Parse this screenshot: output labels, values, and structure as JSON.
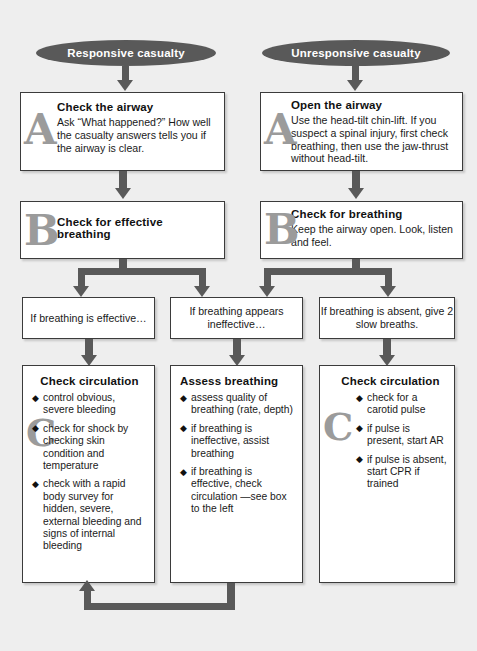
{
  "diagram": {
    "colors": {
      "background": "#eeeeee",
      "connector": "#595959",
      "oval_fill": "#595959",
      "oval_text": "#ffffff",
      "box_fill": "#ffffff",
      "box_border": "#3b3b3b",
      "watermark_letter": "#9b9b9b"
    },
    "bullet_glyph": "◆"
  },
  "branches": {
    "left": {
      "oval_label": "Responsive casualty",
      "step_a": {
        "letter": "A",
        "title": "Check the airway",
        "body": "Ask “What happened?” How well the casualty answers tells you if the airway is clear."
      },
      "step_b": {
        "letter": "B",
        "title": "Check for effective breathing",
        "body": ""
      }
    },
    "right": {
      "oval_label": "Unresponsive casualty",
      "step_a": {
        "letter": "A",
        "title": "Open the airway",
        "body": "Use the head-tilt chin-lift. If you suspect a spinal injury, first check breathing, then use the jaw-thrust without head-tilt."
      },
      "step_b": {
        "letter": "B",
        "title": "Check for breathing",
        "body": "Keep the airway open. Look, listen and feel."
      }
    }
  },
  "conditions": [
    {
      "id": "effective",
      "text": "If breathing is effective…"
    },
    {
      "id": "ineffective",
      "text": "If breathing appears ineffective…"
    },
    {
      "id": "absent",
      "text": "If breathing is absent, give 2 slow breaths."
    }
  ],
  "outcomes": [
    {
      "id": "check-circulation-left",
      "letter": "C",
      "title": "Check circulation",
      "items": [
        "control obvious, severe bleeding",
        "check for shock by checking skin condition and temperature",
        "check with a rapid body survey for hidden, severe, external bleeding and signs of internal bleeding"
      ]
    },
    {
      "id": "assess-breathing",
      "letter": "",
      "title": "Assess breathing",
      "items": [
        "assess quality of breathing (rate, depth)",
        "if breathing is ineffective, assist breathing",
        "if breathing is effective, check circulation —see box to the left"
      ]
    },
    {
      "id": "check-circulation-right",
      "letter": "C",
      "title": "Check circulation",
      "items": [
        "check for a carotid pulse",
        "if pulse is present, start AR",
        "if pulse is absent, start CPR if trained"
      ]
    }
  ]
}
